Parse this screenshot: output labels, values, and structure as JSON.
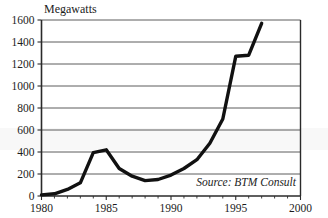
{
  "chart_data": {
    "type": "line",
    "title": "Megawatts",
    "xlabel": "",
    "ylabel": "Megawatts",
    "xlim": [
      1980,
      2000
    ],
    "ylim": [
      0,
      1600
    ],
    "grid": true,
    "legend": "none",
    "annotations": [
      {
        "name": "source-note",
        "text": "Source: BTM Consult"
      }
    ],
    "x_tick_labels": [
      "1980",
      "1985",
      "1990",
      "1995",
      "2000"
    ],
    "x_ticks": [
      1980,
      1985,
      1990,
      1995,
      2000
    ],
    "y_tick_labels": [
      "0",
      "200",
      "400",
      "600",
      "800",
      "1000",
      "1200",
      "1400",
      "1600"
    ],
    "y_ticks": [
      0,
      200,
      400,
      600,
      800,
      1000,
      1200,
      1400,
      1600
    ],
    "series": [
      {
        "name": "Annual installed wind capacity",
        "x": [
          1980,
          1981,
          1982,
          1983,
          1984,
          1985,
          1986,
          1987,
          1988,
          1989,
          1990,
          1991,
          1992,
          1993,
          1994,
          1995,
          1996,
          1997
        ],
        "values": [
          10,
          20,
          60,
          120,
          395,
          420,
          250,
          180,
          140,
          150,
          190,
          250,
          330,
          480,
          700,
          1270,
          1280,
          1570
        ]
      }
    ]
  }
}
